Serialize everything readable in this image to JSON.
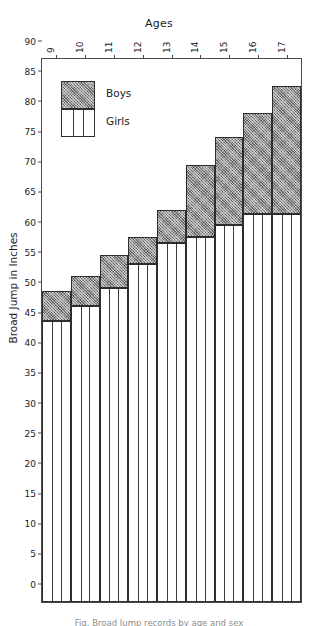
{
  "chart_data": {
    "type": "bar",
    "title": "Ages",
    "xlabel": "Ages",
    "ylabel": "Broad Jump in Inches",
    "ylim": [
      0,
      90
    ],
    "ytick_step": 5,
    "grid": false,
    "stacked_overlay": true,
    "legend_position": "inside-top-left",
    "categories": [
      "9",
      "10",
      "11",
      "12",
      "13",
      "14",
      "15",
      "16",
      "17"
    ],
    "yticks": [
      "90",
      "85",
      "80",
      "75",
      "70",
      "65",
      "60",
      "55",
      "50",
      "45",
      "40",
      "35",
      "30",
      "25",
      "20",
      "15",
      "10",
      "5",
      "0"
    ],
    "series": [
      {
        "name": "Boys",
        "values": [
          51.5,
          54.0,
          57.5,
          60.5,
          65.0,
          72.5,
          77.0,
          81.0,
          85.5
        ]
      },
      {
        "name": "Girls",
        "values": [
          46.5,
          49.0,
          52.0,
          56.0,
          59.5,
          60.5,
          62.5,
          64.3,
          64.3
        ]
      }
    ]
  },
  "legend": {
    "items": [
      {
        "label": "Boys",
        "swatch": "hatched-gray"
      },
      {
        "label": "Girls",
        "swatch": "white-ruled"
      }
    ]
  },
  "caption": {
    "text": "Fig. Broad Jump records by age and sex"
  },
  "colors": {
    "boys_fill": "#8f8f8f",
    "girls_fill": "#ffffff",
    "outline": "#2d2d2d",
    "axis": "#4a4a4a",
    "text": "#1b1b1b"
  }
}
